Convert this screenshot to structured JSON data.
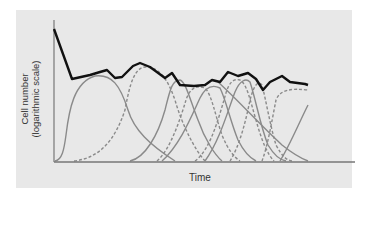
{
  "chart_data": {
    "type": "line",
    "title": "",
    "xlabel": "Time",
    "ylabel_line1": "Cell number",
    "ylabel_line2": "(logarithmic scale)",
    "grid": false,
    "legend": null,
    "colors": {
      "panel_background": "#e8e8e8",
      "axis": "#777777",
      "total_line": "#111111",
      "subpopulation_curves": "#8a8a8a"
    },
    "total_line_points": [
      [
        54,
        29
      ],
      [
        72,
        79
      ],
      [
        90,
        75
      ],
      [
        100,
        72
      ],
      [
        107,
        70
      ],
      [
        115,
        78
      ],
      [
        122,
        77
      ],
      [
        133,
        66
      ],
      [
        140,
        63
      ],
      [
        150,
        67
      ],
      [
        165,
        78
      ],
      [
        172,
        73
      ],
      [
        180,
        85
      ],
      [
        194,
        86
      ],
      [
        205,
        85
      ],
      [
        212,
        80
      ],
      [
        220,
        82
      ],
      [
        228,
        72
      ],
      [
        238,
        76
      ],
      [
        248,
        73
      ],
      [
        256,
        79
      ],
      [
        263,
        90
      ],
      [
        270,
        82
      ],
      [
        282,
        76
      ],
      [
        290,
        82
      ],
      [
        305,
        84
      ],
      [
        308,
        85
      ]
    ],
    "subpopulations": [
      {
        "style": "solid",
        "path": "M55,161 C62,160 64,150 66,135 C69,110 74,82 95,76 C112,74 120,85 128,110 C134,130 150,145 175,161"
      },
      {
        "style": "dashed",
        "path": "M74,161 C100,158 115,140 125,110 C130,82 135,68 145,67 C160,67 168,80 175,100 C182,125 195,150 205,161"
      },
      {
        "style": "solid",
        "path": "M130,161 C145,158 158,135 165,110 C170,90 172,80 180,80 C186,82 190,100 198,120 C205,140 215,155 222,161"
      },
      {
        "style": "dashed",
        "path": "M157,161 C170,150 180,120 186,100 C190,88 196,85 205,88 C212,95 215,115 222,135 C228,150 235,158 240,161"
      },
      {
        "style": "solid",
        "path": "M162,161 C180,145 192,115 200,98 C205,88 212,84 220,88 C226,100 230,120 238,140 C244,152 250,158 256,161"
      },
      {
        "style": "dashed",
        "path": "M195,161 C210,150 218,120 224,100 C228,84 232,78 240,80 C247,84 250,100 256,120 C262,142 268,155 274,161"
      },
      {
        "style": "solid",
        "path": "M205,161 C220,140 228,110 235,92 C240,80 246,78 250,82 C256,100 260,125 268,145 C274,155 280,160 286,161"
      },
      {
        "style": "dashed",
        "path": "M230,161 C240,145 246,120 250,100 C254,85 258,80 262,85 C266,100 270,125 276,145 C282,156 286,160 292,161"
      },
      {
        "style": "solid",
        "path": "M218,82 C238,100 260,125 282,145 C292,153 300,158 308,161"
      },
      {
        "style": "dashed",
        "path": "M262,161 C268,145 272,120 276,100 C280,90 290,88 308,90"
      },
      {
        "style": "solid",
        "path": "M280,161 C290,145 298,125 308,105"
      }
    ],
    "axes": {
      "y_axis": {
        "x": 54,
        "y_top": 20,
        "y_bottom": 162
      },
      "x_axis": {
        "y": 162,
        "x_left": 54,
        "x_right": 355
      }
    }
  }
}
